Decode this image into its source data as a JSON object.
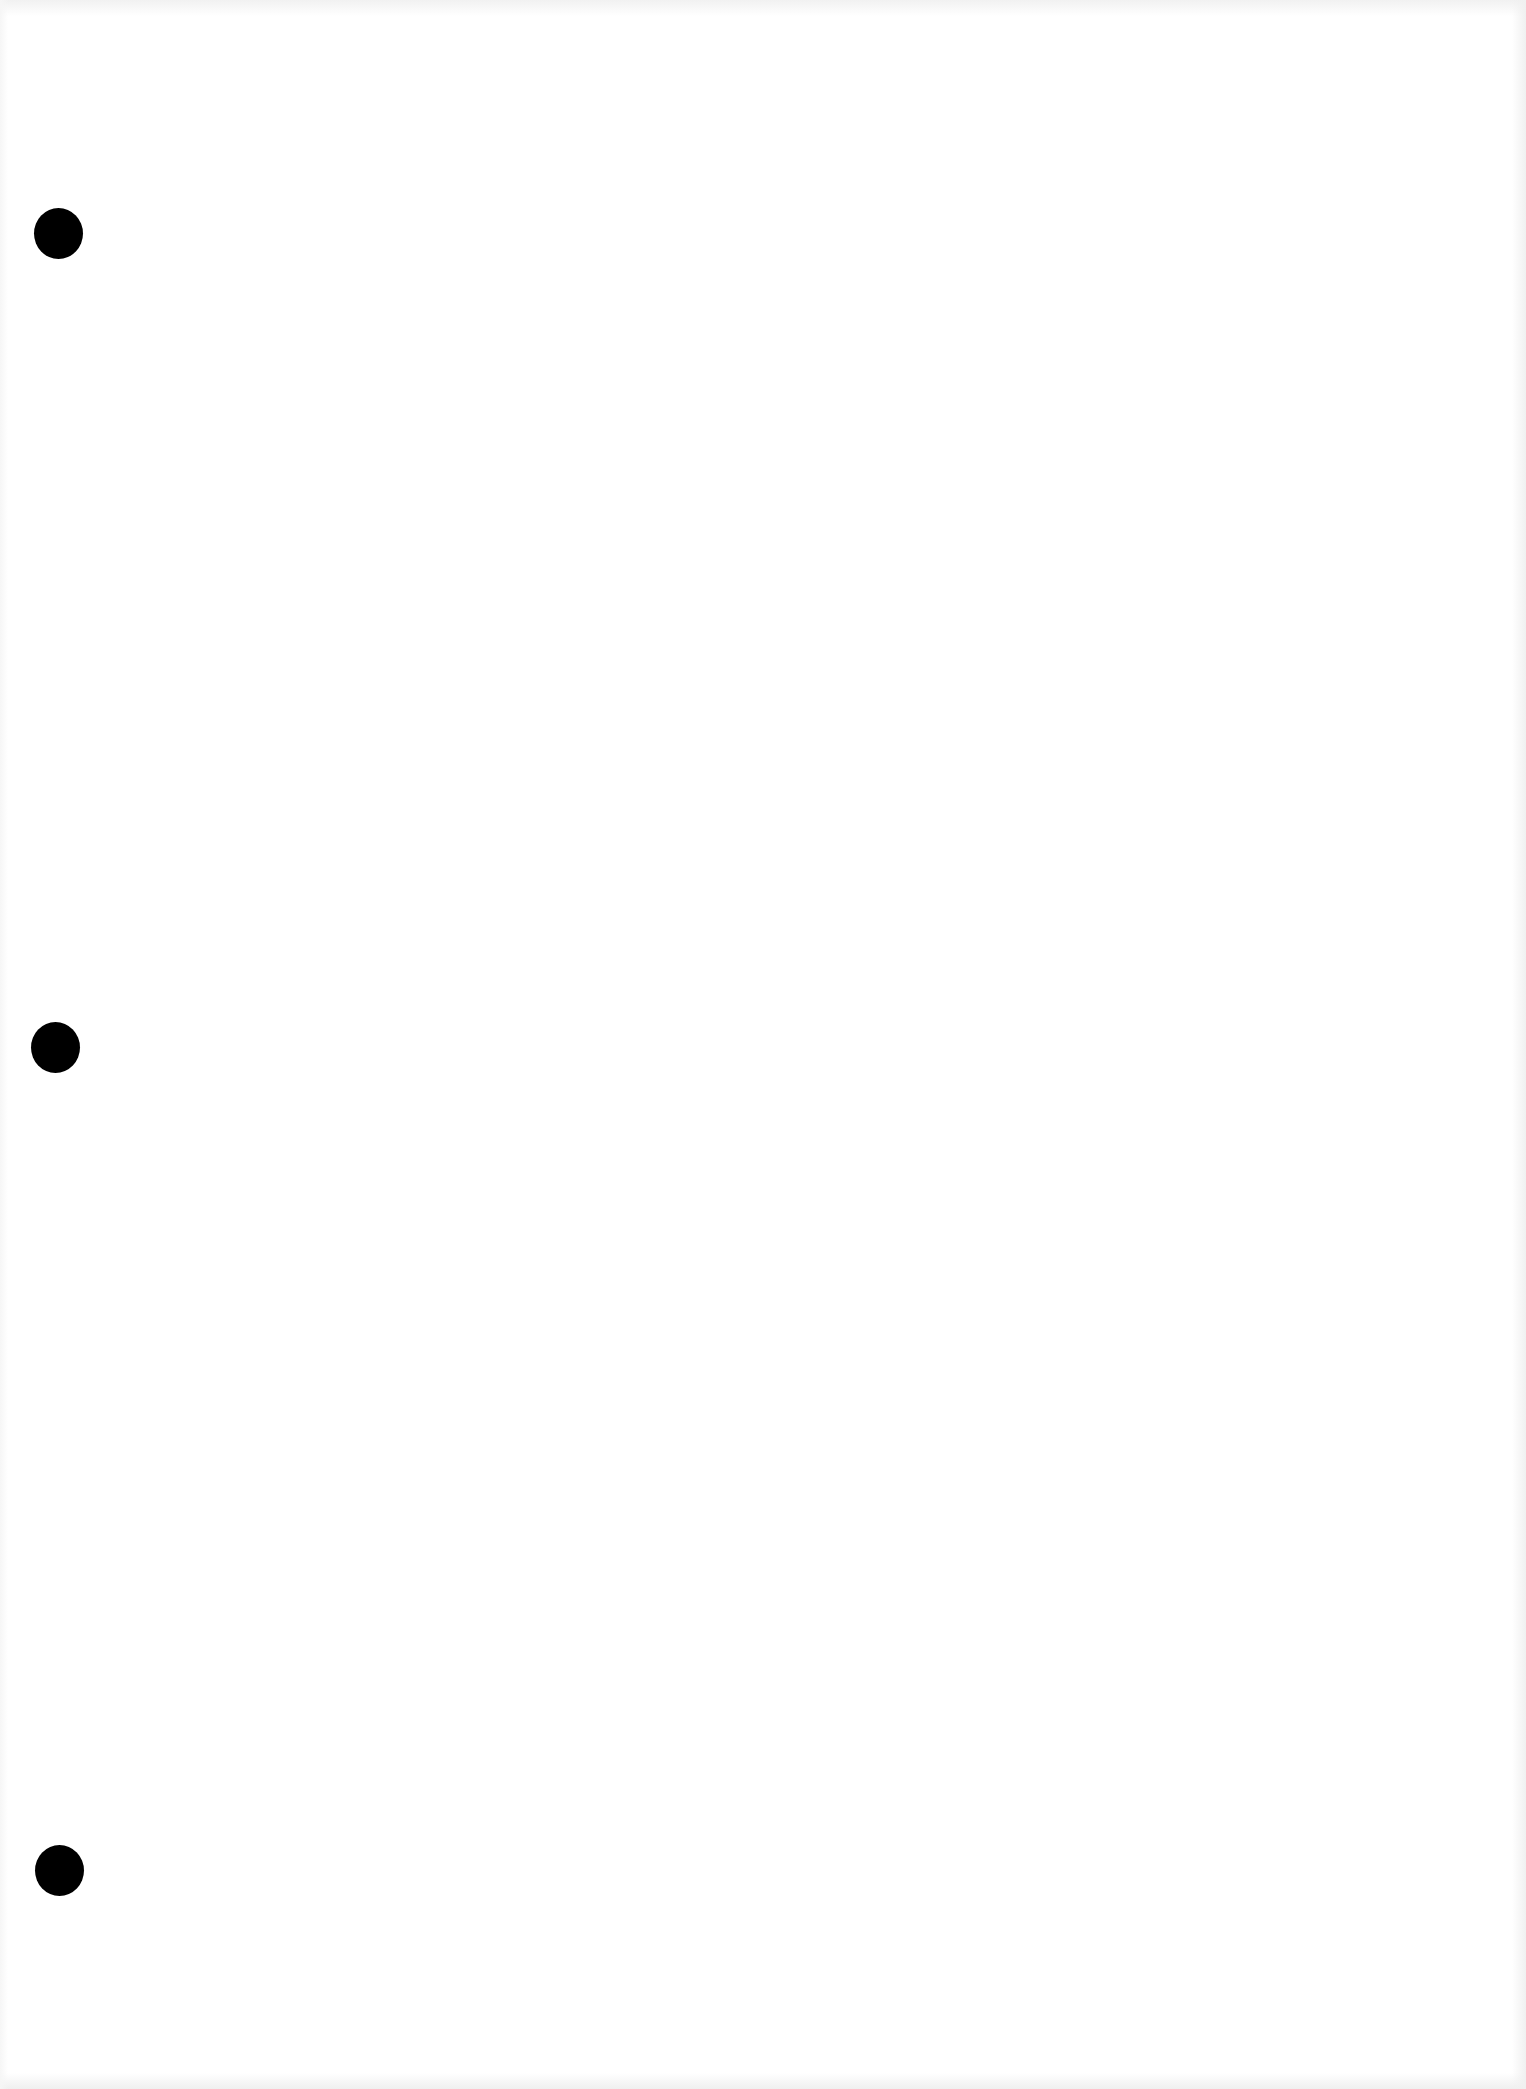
{
  "document": {
    "type": "blank-hole-punched-sheet",
    "background_color": "#ffffff",
    "hole_color": "#000000",
    "punch_holes": [
      {
        "position": "top"
      },
      {
        "position": "middle"
      },
      {
        "position": "bottom"
      }
    ]
  }
}
